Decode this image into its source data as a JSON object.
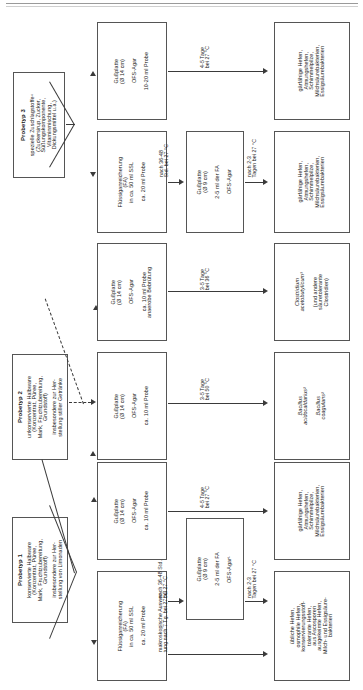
{
  "diagram": {
    "orientation": "rotated-90-ccw",
    "sample_types": [
      {
        "id": "probetyp-1",
        "heading": "Probetyp 1",
        "lines": [
          "konservierte Halbware",
          "(Konzentrat, Püree,",
          "Mark, Fruchtzubereitung,",
          "Grundstoff)",
          "insbesondere zur Her-",
          "stellung von Limonaden"
        ]
      },
      {
        "id": "probetyp-2",
        "heading": "Probetyp 2",
        "lines": [
          "unkonservierte Halbware",
          "(Konzentrat, Püree,",
          "Mark, Fruchtzubereitung,",
          "Grundstoff)",
          "insbesondere zur Her-",
          "stellung stiller Getränke"
        ]
      },
      {
        "id": "probetyp-3",
        "heading": "Probetyp 3",
        "lines": [
          "spezielle Zuschlagstoffe⁴",
          "(Zuckersirup, Zucker,",
          "Süßungskomponente,",
          "Vitaminmischung,",
          "Dickungsmittel u.a.)"
        ]
      }
    ],
    "methods": {
      "p3_gussplatte": {
        "l1": "Gußplatte",
        "l2": "(Ø 14 cm)",
        "l3": "OFS-Agar",
        "l4": "10-20 ml Probe"
      },
      "p3_fa": {
        "l1": "Flüssiganreicherung",
        "l2": "(FA)",
        "l3": "in ca. 50 ml SSL",
        "l4": "ca. 20 ml Probe"
      },
      "p3_gussplatte9": {
        "l1": "Gußplatte",
        "l2": "(Ø 9 cm)",
        "l3": "2-5 ml der FA",
        "l4": "OFS-Agar"
      },
      "p2_anaerob": {
        "l1": "Gußplatte",
        "l2": "(Ø 14 cm)",
        "l3": "OFS-Agar",
        "l4": "ca. 10 ml Probe",
        "l5": "anaerobe Bebrütung"
      },
      "p2_aerob": {
        "l1": "Gußplatte",
        "l2": "(Ø 14 cm)",
        "l3": "OFS-Agar",
        "l4": "ca. 10 ml Probe"
      },
      "p1_gussplatte": {
        "l1": "Gußplatte",
        "l2": "(Ø 14 cm)",
        "l3": "OFS-Agar",
        "l4": "ca. 10 ml Probe"
      },
      "p1_fa": {
        "l1": "Flüssiganreicherung",
        "l2": "(FA)",
        "l3": "in ca. 50 ml SSL",
        "l4": "ca. 20 ml Probe"
      },
      "p1_gussplatte9": {
        "l1": "Gußplatte",
        "l2": "(Ø 9 cm)",
        "l3": "2-5 ml der FA",
        "l4": "OFS-Agar¹"
      }
    },
    "results": {
      "p3_top": {
        "lines": [
          "gärfähige Hefen,",
          "Atmungshefen,",
          "Schimmelpilze,",
          "Milchsäurebakterien,",
          "Essigsäurebakterien"
        ]
      },
      "p3_bot": {
        "lines": [
          "gärfähige Hefen,",
          "Atmungshefen,",
          "Schimmelpilze,",
          "Milchsäurebakterien,",
          "Essigsäurebakterien"
        ]
      },
      "p2_anaerob": {
        "l1": "Clostridium",
        "l2": "acetobutylicum³",
        "l3": "(und andere",
        "l4": "säuretolerante",
        "l5": "Clostridien)"
      },
      "p2_aerob": {
        "l1": "Bacillus",
        "l2": "acidocaldarius²",
        "l3": "Bacillus",
        "l4": "coagulans²"
      },
      "p1_top": {
        "lines": [
          "gärfähige Hefen,",
          "Atmungshefen,",
          "Schimmelpilze,",
          "Milchsäurebakterien,",
          "Essigsäurebakterien"
        ]
      },
      "p1_bot": {
        "lines": [
          "übliche Hefen,",
          "osmophile Hefen,",
          "konservierungsstoff-",
          "tolerante Hefen,",
          "aus Ascosporen",
          "ausgekeimte Hefen,",
          "Milch- und Essigsäure-",
          "bakterien"
        ]
      }
    },
    "arrow_labels": {
      "p3_top": {
        "l1": "4-5 Tage",
        "l2": "bei 27 °C"
      },
      "p3_fa_to_gp": {
        "l1": "nach 36-48",
        "l2": "Std. bei 27 °C"
      },
      "p3_gp_res": {
        "l1": "nach 2-3",
        "l2": "Tagen bei 27 °C"
      },
      "p2_anaerob": {
        "l1": "3-5 Tage",
        "l2": "bei 36 °C"
      },
      "p2_aerob": {
        "l1": "3-5 Tage",
        "l2": "bei 50 °C"
      },
      "p1_top": {
        "l1": "4-5 Tage",
        "l2": "bei 27 °C"
      },
      "p1_fa_to_gp": {
        "l1": "nach 36-48 Std.",
        "l2": "bei 27 °C"
      },
      "p1_gp_res": {
        "l1": "nach 2-3",
        "l2": "Tagen bei 27 °C"
      },
      "p1_makro": {
        "l1": "makroskopische Auswer-",
        "l2": "tung nach 7 Tg. bei 27 °C"
      }
    },
    "colors": {
      "line": "#3a3a3a",
      "border": "#555555",
      "text": "#1a1a1a",
      "rule": "#9a9a9a"
    }
  }
}
